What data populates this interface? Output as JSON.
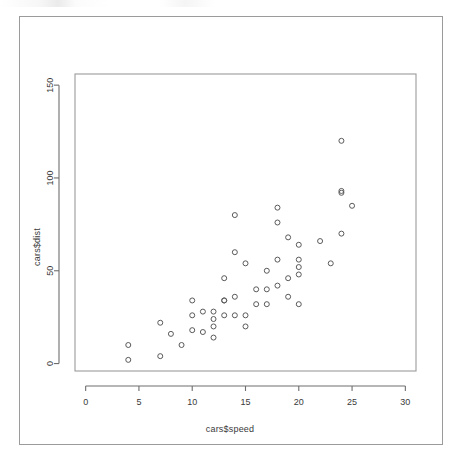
{
  "figure": {
    "background_color": "#ffffff",
    "frame_color": "#9b9b9b",
    "axis_color": "#6e6e6e",
    "point_color": "#5a5a5a",
    "text_color": "#3a3a3a"
  },
  "chart_data": {
    "type": "scatter",
    "title": "",
    "xlabel": "cars$speed",
    "ylabel": "cars$dist",
    "xlim": [
      -1.0,
      31.0
    ],
    "ylim": [
      -4.0,
      156.0
    ],
    "xticks": [
      0,
      5,
      10,
      15,
      20,
      25,
      30
    ],
    "xtick_labels": [
      "0",
      "5",
      "10",
      "15",
      "20",
      "25",
      "30"
    ],
    "yticks": [
      0,
      50,
      100,
      150
    ],
    "ytick_labels": [
      "0",
      "50",
      "100",
      "150"
    ],
    "grid": false,
    "legend": null,
    "marker": "open-circle",
    "n_points": 50,
    "x": [
      4,
      4,
      7,
      7,
      8,
      9,
      10,
      10,
      10,
      11,
      11,
      12,
      12,
      12,
      12,
      13,
      13,
      13,
      13,
      14,
      14,
      14,
      14,
      15,
      15,
      15,
      16,
      16,
      17,
      17,
      17,
      18,
      18,
      18,
      18,
      19,
      19,
      19,
      20,
      20,
      20,
      20,
      20,
      22,
      23,
      24,
      24,
      24,
      24,
      25
    ],
    "y": [
      2,
      10,
      4,
      22,
      16,
      10,
      18,
      26,
      34,
      17,
      28,
      14,
      20,
      24,
      28,
      26,
      34,
      34,
      46,
      26,
      36,
      60,
      80,
      20,
      26,
      54,
      32,
      40,
      32,
      40,
      50,
      42,
      56,
      76,
      84,
      36,
      46,
      68,
      32,
      48,
      52,
      56,
      64,
      66,
      54,
      70,
      92,
      93,
      120,
      85
    ],
    "series_name": "cars"
  }
}
